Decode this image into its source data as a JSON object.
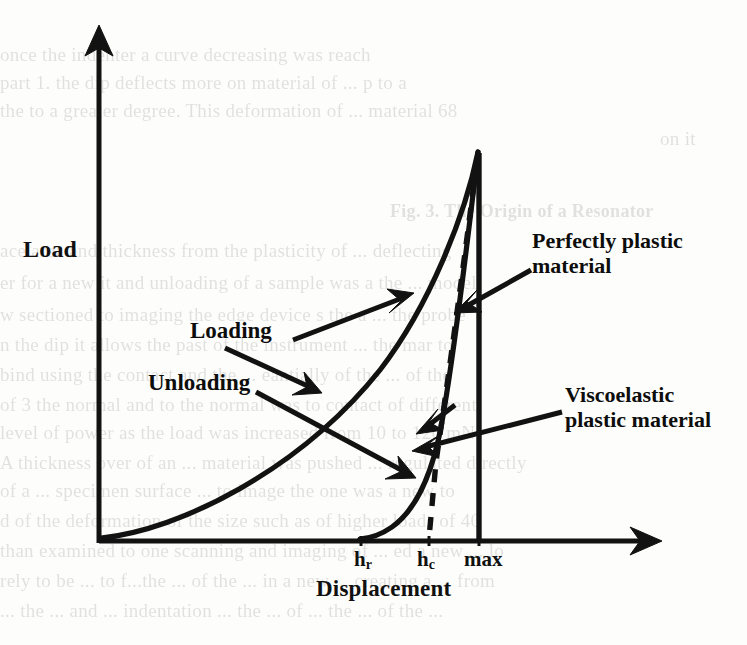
{
  "figure": {
    "type": "scanned-figure",
    "axes": {
      "y_title": "Load",
      "x_title": "Displacement"
    },
    "tick_labels": {
      "hr_base": "h",
      "hr_sub": "r",
      "hc_base": "h",
      "hc_sub": "c",
      "max": "max"
    },
    "callouts": {
      "loading": "Loading",
      "unloading": "Unloading",
      "perfectly_plastic_line1": "Perfectly plastic",
      "perfectly_plastic_line2": "material",
      "viscoelastic_line1": "Viscoelastic",
      "viscoelastic_line2": "plastic material"
    },
    "ink_color": "#121212"
  },
  "chart_data": {
    "type": "line",
    "title": "",
    "xlabel": "Displacement",
    "ylabel": "Load",
    "xlim": [
      0,
      1.0
    ],
    "ylim": [
      0,
      1.0
    ],
    "grid": false,
    "legend": "none",
    "axis_style": "arrow-headed open axes (no tick numbers)",
    "annotated_x_ticks": [
      {
        "label": "h_r",
        "display": "hr",
        "x": 0.46,
        "meaning": "residual depth after full unloading"
      },
      {
        "label": "h_c",
        "display": "hc",
        "x": 0.62,
        "meaning": "contact depth"
      },
      {
        "label": "max",
        "display": "max",
        "x": 0.75,
        "meaning": "maximum displacement"
      }
    ],
    "series": [
      {
        "name": "Loading",
        "style": "solid",
        "description": "Concave-up loading curve rising from the origin to peak load at maximum displacement",
        "points": [
          [
            0.0,
            0.0
          ],
          [
            0.07,
            0.012
          ],
          [
            0.14,
            0.038
          ],
          [
            0.21,
            0.08
          ],
          [
            0.29,
            0.14
          ],
          [
            0.36,
            0.216
          ],
          [
            0.43,
            0.305
          ],
          [
            0.5,
            0.405
          ],
          [
            0.57,
            0.52
          ],
          [
            0.64,
            0.65
          ],
          [
            0.7,
            0.78
          ],
          [
            0.75,
            0.96
          ]
        ]
      },
      {
        "name": "Unloading (viscoelastic plastic material)",
        "style": "solid",
        "description": "Steep unloading curve falling from the peak, bulging slightly right then flattening onto the axis at h_r",
        "points": [
          [
            0.75,
            0.96
          ],
          [
            0.735,
            0.76
          ],
          [
            0.715,
            0.57
          ],
          [
            0.695,
            0.4
          ],
          [
            0.672,
            0.26
          ],
          [
            0.645,
            0.15
          ],
          [
            0.61,
            0.072
          ],
          [
            0.565,
            0.026
          ],
          [
            0.51,
            0.006
          ],
          [
            0.46,
            0.0
          ]
        ]
      },
      {
        "name": "Perfectly plastic material unloading",
        "style": "dashed",
        "description": "Near-vertical dashed unloading line from the peak down to the axis at h_c",
        "points": [
          [
            0.75,
            0.96
          ],
          [
            0.705,
            0.56
          ],
          [
            0.665,
            0.23
          ],
          [
            0.63,
            0.03
          ],
          [
            0.622,
            0.0
          ]
        ]
      },
      {
        "name": "Maximum displacement reference",
        "style": "solid-vertical",
        "description": "Solid vertical line dropped from the peak to the x-axis at maximum displacement",
        "points": [
          [
            0.75,
            0.96
          ],
          [
            0.75,
            0.0
          ]
        ]
      }
    ],
    "annotations": [
      {
        "text": "Loading",
        "points_to": "loading curve",
        "arrow": true
      },
      {
        "text": "Unloading",
        "points_to": "unloading curve",
        "arrow": true
      },
      {
        "text": "Perfectly plastic material",
        "points_to": "dashed vertical unloading line",
        "arrow": true
      },
      {
        "text": "Viscoelastic plastic material",
        "points_to": "curved unloading branch",
        "arrow": true
      }
    ]
  },
  "bleed_text": {
    "lines": [
      {
        "x": 0,
        "y": 40,
        "text": "once the indenter a curve decreasing was reach",
        "bold": false
      },
      {
        "x": 0,
        "y": 68,
        "text": "part 1. the dip deflects more on material of  ... p to a",
        "bold": false
      },
      {
        "x": 0,
        "y": 96,
        "text": "the to a greater degree. This deformation of ... material 68",
        "bold": false
      },
      {
        "x": 660,
        "y": 124,
        "text": "on it",
        "bold": false
      },
      {
        "x": 390,
        "y": 196,
        "text": "Fig. 3.  The Origin of a Resonator",
        "bold": true
      },
      {
        "x": 0,
        "y": 236,
        "text": "ace area and thickness from the plasticity of ... deflecting",
        "bold": false
      },
      {
        "x": 0,
        "y": 268,
        "text": "er for a new it and unloading of a sample was a the ... model",
        "bold": false
      },
      {
        "x": 0,
        "y": 300,
        "text": "w sectioned to imaging the edge device s the a ... the probe",
        "bold": false
      },
      {
        "x": 0,
        "y": 330,
        "text": "n the dip it allows the past of the instrument ... the mar to",
        "bold": false
      },
      {
        "x": 0,
        "y": 360,
        "text": "bind using the contact and the ... eantially of the ... of the",
        "bold": false
      },
      {
        "x": 0,
        "y": 390,
        "text": "of 3 the normal and to the normal was to contact of different",
        "bold": false
      },
      {
        "x": 0,
        "y": 418,
        "text": "level of power as the load was increased from 10 to 120 mN.",
        "bold": false
      },
      {
        "x": 0,
        "y": 448,
        "text": "A thickness over of an ... material was pushed ... regulated directly",
        "bold": false
      },
      {
        "x": 0,
        "y": 476,
        "text": "of a ... specimen surface ... to image the one was a new to",
        "bold": false
      },
      {
        "x": 0,
        "y": 506,
        "text": "d of the deformation of the size such as of higher loads of 40",
        "bold": false
      },
      {
        "x": 0,
        "y": 536,
        "text": "than examined to one scanning and imaging of ... ed a new ... lo",
        "bold": false
      },
      {
        "x": 0,
        "y": 566,
        "text": "rely to be ... to f...the ... of the ... in a new ... creating a ... from",
        "bold": false
      },
      {
        "x": 0,
        "y": 596,
        "text": "... the ... and ... indentation ... the ... of ... the ... of the ...",
        "bold": false
      }
    ]
  }
}
